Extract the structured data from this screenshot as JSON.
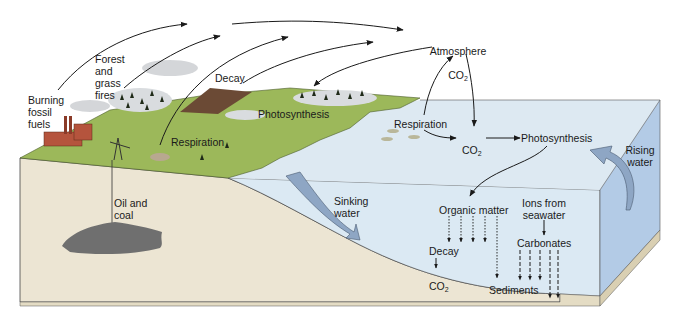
{
  "diagram": {
    "type": "carbon-cycle-illustration",
    "colors": {
      "land_green": "#9cb85a",
      "soil": "#ece5d3",
      "ocean_surface": "#dbe9f3",
      "ocean_side": "#b3cbe6",
      "oil_deposit": "#6f6f6f",
      "decay_patch": "#6b4a35",
      "arrow": "#1a1a1a",
      "current_arrow": "#8ea6c4",
      "factory": "#b5543d"
    },
    "labels": {
      "atmosphere_line1": "Atmosphere",
      "atmosphere_co2": "CO",
      "atmosphere_sub": "2",
      "burning_fossil_fuels": "Burning\nfossil\nfuels",
      "forest_fires": "Forest\nand\ngrass\nfires",
      "decay_land": "Decay",
      "photosynthesis_land": "Photosynthesis",
      "respiration_land": "Respiration",
      "oil_and_coal": "Oil and\ncoal",
      "respiration_ocean": "Respiration",
      "ocean_co2": "CO",
      "ocean_co2_sub": "2",
      "photosynthesis_ocean": "Photosynthesis",
      "rising_water": "Rising\nwater",
      "sinking_water": "Sinking\nwater",
      "organic_matter": "Organic matter",
      "ions_from_seawater": "Ions from\nseawater",
      "carbonates": "Carbonates",
      "decay_ocean": "Decay",
      "deep_co2": "CO",
      "deep_co2_sub": "2",
      "sediments": "Sediments"
    }
  }
}
